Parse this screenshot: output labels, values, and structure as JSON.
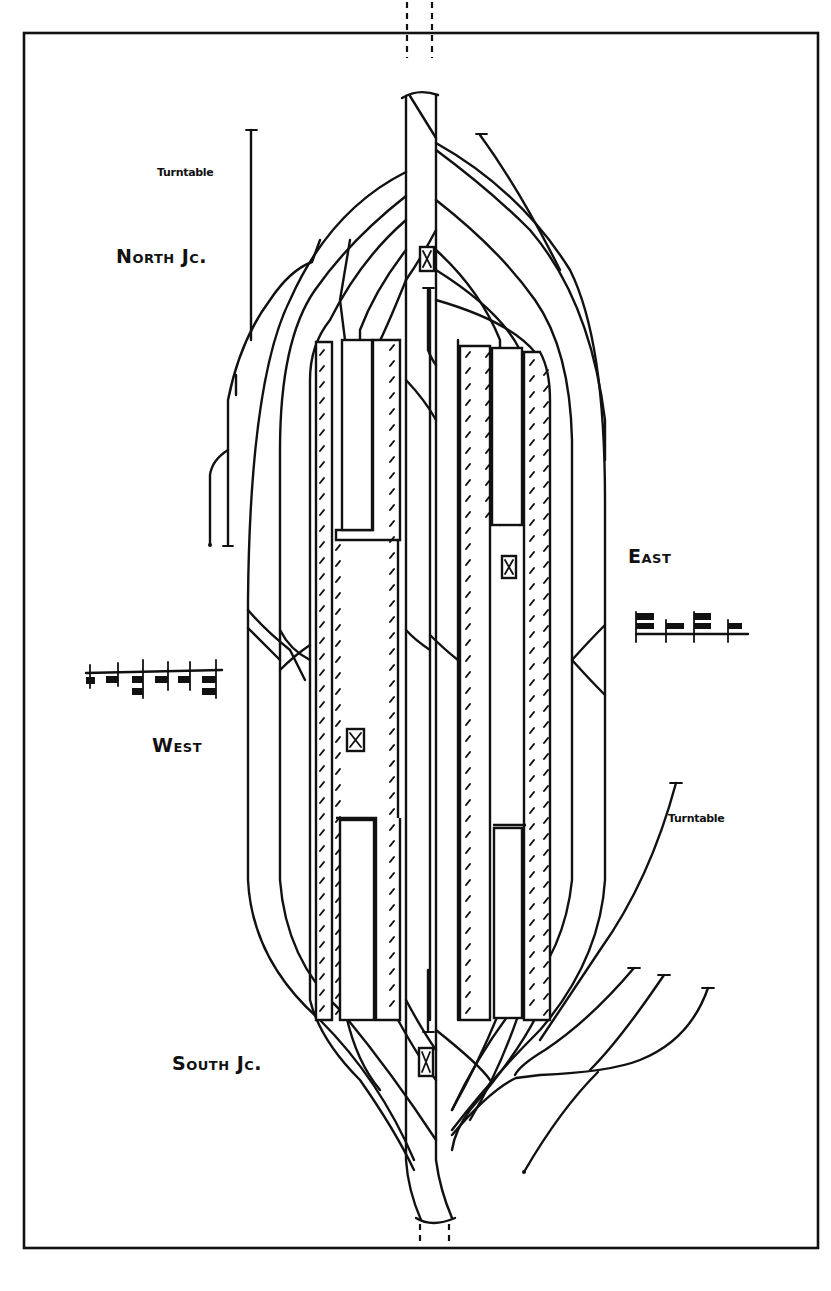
{
  "figure": {
    "type": "railway station track plan (hand-drawn)",
    "border": true
  },
  "labels": {
    "north_junction": "North Jc.",
    "south_junction": "South Jc.",
    "east": "East",
    "west": "West",
    "turntable_north": "Turntable",
    "turntable_south": "Turntable"
  },
  "elements": {
    "platforms": [
      {
        "id": "west-outer-platform",
        "side": "west"
      },
      {
        "id": "west-north-bay-island",
        "side": "west"
      },
      {
        "id": "west-south-bay-island",
        "side": "west"
      },
      {
        "id": "east-outer-platform",
        "side": "east"
      },
      {
        "id": "east-north-bay-island",
        "side": "east"
      },
      {
        "id": "east-south-bay-island",
        "side": "east"
      }
    ],
    "signal_boxes": [
      "north-signal-box",
      "west-signal-box",
      "east-signal-box",
      "south-signal-box"
    ],
    "sidings": [
      "west-sidings",
      "east-sidings"
    ],
    "junctions": [
      "North Jc.",
      "South Jc."
    ]
  },
  "colors": {
    "ink": "#111111",
    "paper": "#ffffff"
  }
}
